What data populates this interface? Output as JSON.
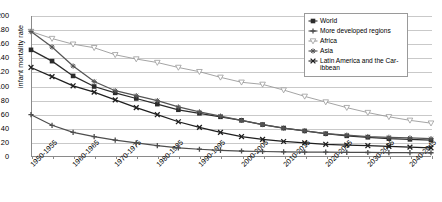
{
  "chart_data": {
    "type": "line",
    "title": "",
    "xlabel": "",
    "ylabel": "infant mortality rate",
    "ylim": [
      0,
      200
    ],
    "yticks": [
      0,
      20,
      40,
      60,
      80,
      100,
      120,
      140,
      160,
      180,
      200
    ],
    "grid": true,
    "legend_position": "top-right",
    "categories": [
      "1950-1955",
      "1955-1960",
      "1960-1965",
      "1965-1970",
      "1970-1975",
      "1975-1980",
      "1980-1985",
      "1985-1990",
      "1990-1995",
      "1995-2000",
      "2000-2005",
      "2005-2010",
      "2010-2015",
      "2015-2020",
      "2020-2025",
      "2025-2030",
      "2030-2035",
      "2035-2040",
      "2040-2045",
      "2045-2050"
    ],
    "xtick_labels": [
      "1950-1955",
      "1960-1965",
      "1970-1975",
      "1980-1985",
      "1990-1995",
      "2000-2005",
      "2010-2015",
      "2020-2025",
      "2030-2035",
      "2040-2045"
    ],
    "series": [
      {
        "name": "World",
        "marker": "square",
        "color": "#2b2b2b",
        "values": [
          152,
          136,
          115,
          100,
          91,
          83,
          75,
          67,
          62,
          57,
          52,
          46,
          41,
          37,
          33,
          30,
          28,
          26,
          25,
          24
        ]
      },
      {
        "name": "More developed regions",
        "marker": "plus",
        "color": "#4d4d4d",
        "values": [
          60,
          45,
          35,
          29,
          24,
          20,
          16,
          13,
          11,
          9.5,
          8.5,
          7.8,
          7.3,
          7.0,
          6.8,
          6.6,
          6.4,
          6.2,
          6.1,
          6.0
        ]
      },
      {
        "name": "Africa",
        "marker": "triangle-down-open",
        "color": "#9a9a9a",
        "values": [
          178,
          168,
          160,
          155,
          145,
          139,
          134,
          127,
          121,
          113,
          106,
          103,
          95,
          86,
          78,
          70,
          63,
          57,
          52,
          48
        ]
      },
      {
        "name": "Asia",
        "marker": "star",
        "color": "#555555",
        "values": [
          178,
          156,
          129,
          107,
          94,
          87,
          80,
          71,
          64,
          58,
          52,
          46,
          41,
          37,
          33,
          31,
          29,
          28,
          27,
          26
        ]
      },
      {
        "name": "Latin America and the Caribbean",
        "marker": "cross",
        "color": "#1f1f1f",
        "values": [
          127,
          114,
          101,
          92,
          81,
          70,
          60,
          50,
          42,
          35,
          29,
          25,
          22,
          20,
          18,
          17,
          16,
          15,
          14,
          13
        ]
      }
    ]
  },
  "legend": {
    "items": [
      {
        "label": "World",
        "marker": "diamond-icon"
      },
      {
        "label": "More developed regions",
        "marker": "plus-icon"
      },
      {
        "label": "Africa",
        "marker": "triangle-down-open-icon"
      },
      {
        "label": "Asia",
        "marker": "star-icon"
      },
      {
        "label": "Latin America and the Car-",
        "label2": "ibbean",
        "marker": "cross-icon"
      }
    ]
  }
}
